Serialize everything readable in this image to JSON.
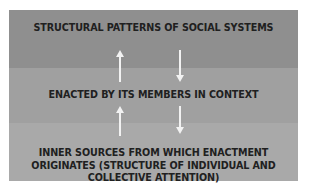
{
  "diagram": {
    "levels": [
      {
        "label": "STRUCTURAL PATTERNS OF SOCIAL SYSTEMS",
        "color": "#8f8f8f"
      },
      {
        "label": "ENACTED BY ITS MEMBERS IN CONTEXT",
        "color": "#a0a0a0"
      },
      {
        "label": "INNER SOURCES FROM WHICH ENACTMENT ORIGINATES (STRUCTURE OF INDIVIDUAL AND COLLECTIVE ATTENTION)",
        "color": "#a9a9a9"
      }
    ],
    "arrows": [
      {
        "direction": "up",
        "from": "ENACTED BY ITS MEMBERS IN CONTEXT",
        "to": "STRUCTURAL PATTERNS OF SOCIAL SYSTEMS"
      },
      {
        "direction": "down",
        "from": "STRUCTURAL PATTERNS OF SOCIAL SYSTEMS",
        "to": "ENACTED BY ITS MEMBERS IN CONTEXT"
      },
      {
        "direction": "up",
        "from": "INNER SOURCES FROM WHICH ENACTMENT ORIGINATES (STRUCTURE OF INDIVIDUAL AND COLLECTIVE ATTENTION)",
        "to": "ENACTED BY ITS MEMBERS IN CONTEXT"
      },
      {
        "direction": "down",
        "from": "ENACTED BY ITS MEMBERS IN CONTEXT",
        "to": "INNER SOURCES FROM WHICH ENACTMENT ORIGINATES (STRUCTURE OF INDIVIDUAL AND COLLECTIVE ATTENTION)"
      }
    ],
    "arrow_color": "#f2f2f2",
    "text_color": "#202020"
  }
}
